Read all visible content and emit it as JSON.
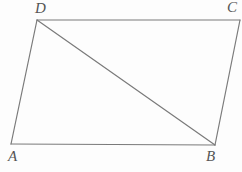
{
  "figure": {
    "name": "parallelogram-abcd-with-diagonal",
    "background_color": "#fdfdfd",
    "stroke_color": "#7a7a7a",
    "stroke_width": 1.2,
    "label_color": "#555555",
    "vertices": [
      {
        "id": "A",
        "label": "A",
        "x": 11,
        "y": 144,
        "label_x": 8,
        "label_y": 149
      },
      {
        "id": "B",
        "label": "B",
        "x": 215,
        "y": 145,
        "label_x": 206,
        "label_y": 149
      },
      {
        "id": "C",
        "label": "C",
        "x": 240,
        "y": 20,
        "label_x": 227,
        "label_y": 0
      },
      {
        "id": "D",
        "label": "D",
        "x": 37,
        "y": 20,
        "label_x": 35,
        "label_y": 1
      }
    ],
    "edges": [
      {
        "id": "AB",
        "from": "A",
        "to": "B",
        "kind": "side"
      },
      {
        "id": "BC",
        "from": "B",
        "to": "C",
        "kind": "side"
      },
      {
        "id": "CD",
        "from": "C",
        "to": "D",
        "kind": "side"
      },
      {
        "id": "DA",
        "from": "D",
        "to": "A",
        "kind": "side"
      },
      {
        "id": "DB",
        "from": "D",
        "to": "B",
        "kind": "diagonal"
      }
    ],
    "caption_remnant": ""
  },
  "chart_data": {
    "type": "diagram",
    "title": "",
    "shape": "quadrilateral",
    "labels": [
      "A",
      "B",
      "C",
      "D"
    ],
    "points": {
      "A": [
        11,
        144
      ],
      "B": [
        215,
        145
      ],
      "C": [
        240,
        20
      ],
      "D": [
        37,
        20
      ]
    },
    "segments": [
      "A-B",
      "B-C",
      "C-D",
      "D-A",
      "D-B"
    ],
    "xlabel": "",
    "ylabel": "",
    "grid": false,
    "legend": "none"
  }
}
